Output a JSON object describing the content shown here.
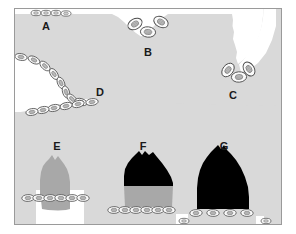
{
  "figure": {
    "type": "scientific-schematic",
    "background_color": "#ffffff",
    "frame_color": "#9a9a9a",
    "tissue_fill": "#d9d9d9",
    "void_fill": "#ffffff",
    "mid_gray_fill": "#a8a8a8",
    "dark_fill": "#000000",
    "cell_outline_color": "#555555",
    "cell_fill_color": "#fbfbfb",
    "frame": {
      "x": 14,
      "y": 8,
      "width": 268,
      "height": 217
    }
  },
  "labels": [
    {
      "id": "A",
      "text": "A",
      "x": 46,
      "y": 27,
      "region": "flat-apical-surface"
    },
    {
      "id": "B",
      "text": "B",
      "x": 148,
      "y": 53,
      "region": "narrow-invagination"
    },
    {
      "id": "C",
      "text": "C",
      "x": 233,
      "y": 96,
      "region": "lateral-cleft"
    },
    {
      "id": "D",
      "text": "D",
      "x": 100,
      "y": 93,
      "region": "deep-concave-bay"
    },
    {
      "id": "E",
      "text": "E",
      "x": 57,
      "y": 147,
      "region": "mid-gray-dome"
    },
    {
      "id": "F",
      "text": "F",
      "x": 143,
      "y": 147,
      "region": "dark-capped-dome"
    },
    {
      "id": "G",
      "text": "G",
      "x": 224,
      "y": 147,
      "region": "fully-dark-dome"
    }
  ],
  "regions": [
    {
      "id": "A",
      "name": "flat-apical-surface",
      "fill": "#d9d9d9",
      "cell_count": 5,
      "note": "Flat horizontal boundary at upper left with a short row of small cells"
    },
    {
      "id": "B",
      "name": "narrow-invagination",
      "fill": "#d9d9d9",
      "cell_count": 3,
      "note": "Shallow V-shaped notch in the upper boundary lined by three larger cells"
    },
    {
      "id": "C",
      "name": "lateral-cleft",
      "fill": "#d9d9d9",
      "cell_count": 3,
      "note": "V-shaped cleft descending from the upper right boundary with three cells at its base"
    },
    {
      "id": "D",
      "name": "deep-concave-bay",
      "fill": "#d9d9d9",
      "cell_count": 14,
      "note": "Large rounded concave bay on the left lined by a long chain of cells"
    },
    {
      "id": "E",
      "name": "mid-gray-dome",
      "fill": "#a8a8a8",
      "cell_count": 8,
      "note": "Medium-gray dome whose base is lined with cells, open white space beneath"
    },
    {
      "id": "F",
      "name": "dark-capped-dome",
      "fill": "#000000",
      "secondary_fill": "#a8a8a8",
      "cell_count": 11,
      "note": "Dome with a black upper cap over a medium-gray lower band, cells along the base"
    },
    {
      "id": "G",
      "name": "fully-dark-dome",
      "fill": "#000000",
      "cell_count": 7,
      "note": "Entirely black dome with cells along the base"
    }
  ]
}
